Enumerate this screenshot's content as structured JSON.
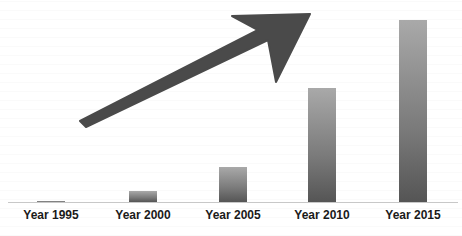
{
  "chart_data": {
    "type": "bar",
    "title": "",
    "xlabel": "",
    "ylabel": "",
    "categories": [
      "Year 1995",
      "Year 2000",
      "Year 2005",
      "Year 2010",
      "Year 2015"
    ],
    "values": [
      1,
      11,
      35,
      114,
      182
    ],
    "value_units": "relative (no y-axis shown)",
    "ylim": [
      0,
      190
    ],
    "grid": false,
    "legend": null,
    "annotations": [
      {
        "type": "arrow",
        "description": "large upward-trending arrow indicating growth",
        "color": "#4a4a4a"
      }
    ],
    "colors": {
      "bar_top": "#a9a9a9",
      "bar_bottom": "#555555",
      "arrow": "#4a4a4a",
      "axis": "#c8c8c8"
    }
  },
  "layout": {
    "bar_centers_x": [
      51,
      143,
      233,
      322,
      413
    ],
    "baseline_y": 202,
    "bar_width": 28
  }
}
